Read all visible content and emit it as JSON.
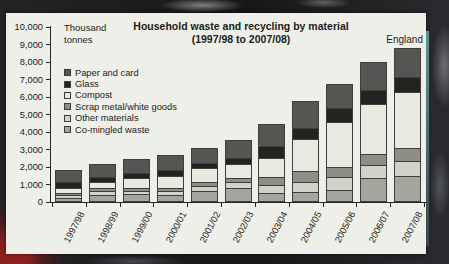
{
  "chart_data": {
    "type": "bar",
    "stacked": true,
    "title": "Household waste and recycling by material",
    "subtitle": "(1997/98 to 2007/08)",
    "region": "England",
    "unit_label_line1": "Thousand",
    "unit_label_line2": "tonnes",
    "xlabel": "",
    "ylabel": "Thousand tonnes",
    "ylim": [
      0,
      10000
    ],
    "ytick_step": 1000,
    "ytick_labels": [
      "0",
      "1,000",
      "2,000",
      "3,000",
      "4,000",
      "5,000",
      "6,000",
      "7,000",
      "8,000",
      "9,000",
      "10,000"
    ],
    "grid": false,
    "legend_position": "upper-left-inside",
    "categories": [
      "1997/98",
      "1998/99",
      "1999/00",
      "2000/01",
      "2001/02",
      "2002/03",
      "2003/04",
      "2004/05",
      "2005/06",
      "2006/07",
      "2007/08"
    ],
    "series": [
      {
        "name": "Paper and card",
        "color": "#555553",
        "values": [
          680,
          670,
          720,
          750,
          800,
          950,
          1170,
          1470,
          1330,
          1490,
          1570
        ]
      },
      {
        "name": "Glass",
        "color": "#232321",
        "values": [
          345,
          320,
          320,
          380,
          340,
          340,
          720,
          630,
          830,
          800,
          860
        ]
      },
      {
        "name": "Compost",
        "color": "#e9e9e1",
        "values": [
          245,
          345,
          520,
          650,
          760,
          800,
          1050,
          1840,
          2540,
          2860,
          3200
        ]
      },
      {
        "name": "Scrap metal/white goods",
        "color": "#8e8e86",
        "values": [
          155,
          155,
          190,
          190,
          230,
          270,
          480,
          580,
          570,
          660,
          770
        ]
      },
      {
        "name": "Other materials",
        "color": "#d2d2ca",
        "values": [
          155,
          230,
          190,
          225,
          310,
          345,
          435,
          570,
          760,
          760,
          850
        ]
      },
      {
        "name": "Co-mingled waste",
        "color": "#a5a59d",
        "values": [
          160,
          330,
          390,
          355,
          560,
          715,
          465,
          540,
          620,
          1290,
          1420
        ]
      }
    ],
    "colors": {
      "panel_background": "#eeefe9",
      "axis": "#26262a",
      "text": "#1c1c1a",
      "photo_border": "#1b1c1e",
      "red_patch": "#8e201e"
    }
  }
}
